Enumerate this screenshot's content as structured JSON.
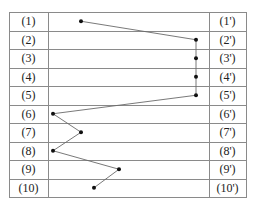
{
  "left_labels": [
    "(1)",
    "(2)",
    "(3)",
    "(4)",
    "(5)",
    "(6)",
    "(7)",
    "(8)",
    "(9)",
    "(10)"
  ],
  "right_labels": [
    "(1')",
    "(2')",
    "(3')",
    "(4')",
    "(5')",
    "(6')",
    "(7')",
    "(8')",
    "(9')",
    "(10')"
  ],
  "points": [
    {
      "row": 1,
      "x": 81
    },
    {
      "row": 2,
      "x": 196
    },
    {
      "row": 3,
      "x": 196
    },
    {
      "row": 4,
      "x": 196
    },
    {
      "row": 5,
      "x": 196
    },
    {
      "row": 6,
      "x": 53
    },
    {
      "row": 7,
      "x": 81
    },
    {
      "row": 8,
      "x": 53
    },
    {
      "row": 9,
      "x": 119
    },
    {
      "row": 10,
      "x": 94
    }
  ],
  "colors": {
    "grid": "#8a8a8a",
    "line": "#6a6a6a",
    "dot": "#111111"
  }
}
